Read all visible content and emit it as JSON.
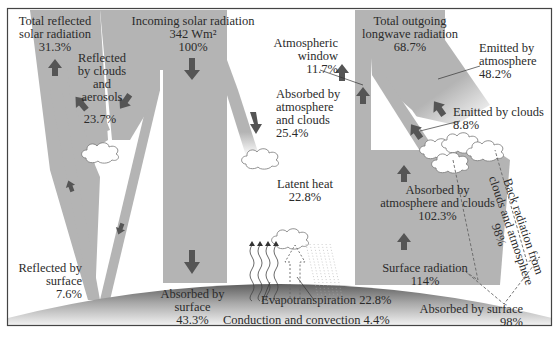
{
  "colors": {
    "beam": "#b4b4b4",
    "arrow": "#555555",
    "frame": "#444444",
    "ground_dark": "#6e6e6e",
    "ground_light": "#f2f2f2",
    "text": "#2b2b2b"
  },
  "labels": {
    "total_reflected": {
      "line1": "Total reflected",
      "line2": "solar radiation",
      "value": "31.3%"
    },
    "reflected_clouds": {
      "line1": "Reflected",
      "line2": "by clouds",
      "line3": "and",
      "line4": "aerosols",
      "value": "23.7%"
    },
    "incoming": {
      "line1": "Incoming solar radiation",
      "line2": "342 Wm²",
      "value": "100%"
    },
    "atm_window": {
      "line1": "Atmospheric",
      "line2": "window",
      "value": "11.7%"
    },
    "absorbed_atm": {
      "line1": "Absorbed by",
      "line2": "atmosphere",
      "line3": "and clouds",
      "value": "25.4%"
    },
    "total_outgoing": {
      "line1": "Total outgoing",
      "line2": "longwave radiation",
      "value": "68.7%"
    },
    "emitted_atm": {
      "line1": "Emitted by",
      "line2": "atmosphere",
      "value": "48.2%"
    },
    "emitted_clouds": {
      "line1": "Emitted by clouds",
      "value": "8.8%"
    },
    "latent_heat": {
      "line1": "Latent heat",
      "value": "22.8%"
    },
    "absorbed_atm_clouds": {
      "line1": "Absorbed by",
      "line2": "atmosphere and clouds",
      "value": "102.3%"
    },
    "back_radiation": {
      "line1": "Back radiation from",
      "line2": "clouds and atmosphere",
      "value": "98%"
    },
    "surface_radiation": {
      "line1": "Surface radiation",
      "value": "114%"
    },
    "reflected_surface": {
      "line1": "Reflected by",
      "line2": "surface",
      "value": "7.6%"
    },
    "absorbed_surface": {
      "line1": "Absorbed by",
      "line2": "surface",
      "value": "43.3%"
    },
    "evapotranspiration": {
      "text": "Evapotranspiration 22.8%"
    },
    "conduction": {
      "text": "Conduction and convection 4.4%"
    },
    "absorbed_surface_back": {
      "line1": "Absorbed by surface",
      "value": "98%"
    }
  }
}
